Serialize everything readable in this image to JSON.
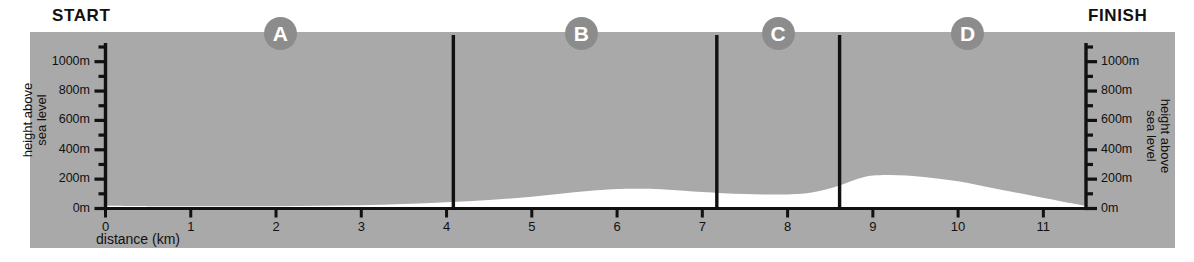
{
  "labels": {
    "start": "START",
    "finish": "FINISH"
  },
  "axes": {
    "y_title": "height above\nsea level",
    "y_title_line1": "height above",
    "y_title_line2": "sea level",
    "x_title": "distance (km)",
    "y_ticks": [
      "0m",
      "200m",
      "400m",
      "600m",
      "800m",
      "1000m"
    ],
    "x_ticks": [
      "0",
      "1",
      "2",
      "3",
      "4",
      "5",
      "6",
      "7",
      "8",
      "9",
      "10",
      "11"
    ]
  },
  "stage_markers": [
    {
      "label": "A",
      "km": 2.05
    },
    {
      "label": "B",
      "km": 5.58
    },
    {
      "label": "C",
      "km": 7.89
    },
    {
      "label": "D",
      "km": 10.11
    }
  ],
  "colors": {
    "panel_background": "#a9a9a9",
    "profile_fill": "#ffffff",
    "axis": "#111111",
    "marker_circle": "#8c8c8c",
    "marker_text": "#ffffff",
    "page_background": "#ffffff"
  },
  "chart_data": {
    "type": "area",
    "title": "",
    "subtitle": "",
    "xlabel": "distance (km)",
    "ylabel": "height above sea level",
    "xlim": [
      0,
      11.5
    ],
    "ylim": [
      0,
      1100
    ],
    "x_tick_values": [
      0,
      1,
      2,
      3,
      4,
      5,
      6,
      7,
      8,
      9,
      10,
      11
    ],
    "y_tick_values": [
      0,
      200,
      400,
      600,
      800,
      1000
    ],
    "y_minor_tick_values": [
      100,
      300,
      500,
      700,
      900,
      1100
    ],
    "y_unit": "m",
    "x_unit": "km",
    "grid": false,
    "legend": false,
    "series": [
      {
        "name": "elevation profile",
        "x": [
          0,
          0.5,
          1,
          1.5,
          2,
          2.5,
          3,
          3.5,
          4,
          4.5,
          5,
          5.5,
          6,
          6.3,
          6.6,
          7,
          7.5,
          8,
          8.3,
          8.6,
          8.9,
          9.2,
          9.6,
          10,
          10.4,
          10.8,
          11.2,
          11.5
        ],
        "y": [
          18,
          16,
          15,
          15,
          16,
          18,
          22,
          30,
          42,
          58,
          80,
          110,
          132,
          134,
          128,
          112,
          98,
          96,
          110,
          155,
          215,
          228,
          215,
          185,
          140,
          95,
          50,
          18
        ]
      }
    ],
    "stage_divider_km": [
      4.08,
      7.17,
      8.61
    ],
    "annotations": [
      {
        "text": "START",
        "position": "left-top"
      },
      {
        "text": "FINISH",
        "position": "right-top"
      },
      {
        "text": "A",
        "km": 2.05
      },
      {
        "text": "B",
        "km": 5.58
      },
      {
        "text": "C",
        "km": 7.89
      },
      {
        "text": "D",
        "km": 10.11
      }
    ]
  }
}
